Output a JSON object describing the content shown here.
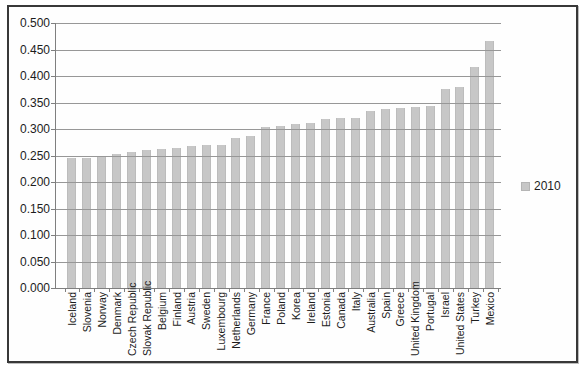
{
  "legend": {
    "label": "2010"
  },
  "chart_data": {
    "type": "bar",
    "title": "",
    "xlabel": "",
    "ylabel": "",
    "categories": [
      "Iceland",
      "Slovenia",
      "Norway",
      "Denmark",
      "Czech Republic",
      "Slovak Republic",
      "Belgium",
      "Finland",
      "Austria",
      "Sweden",
      "Luxembourg",
      "Netherlands",
      "Germany",
      "France",
      "Poland",
      "Korea",
      "Ireland",
      "Estonia",
      "Canada",
      "Italy",
      "Australia",
      "Spain",
      "Greece",
      "United Kingdom",
      "Portugal",
      "Israel",
      "United States",
      "Turkey",
      "Mexico"
    ],
    "series": [
      {
        "name": "2010",
        "values": [
          0.246,
          0.246,
          0.249,
          0.252,
          0.256,
          0.261,
          0.262,
          0.265,
          0.267,
          0.269,
          0.27,
          0.283,
          0.286,
          0.303,
          0.305,
          0.31,
          0.311,
          0.319,
          0.32,
          0.321,
          0.334,
          0.338,
          0.339,
          0.341,
          0.344,
          0.376,
          0.38,
          0.417,
          0.466
        ]
      }
    ],
    "ylim": [
      0.0,
      0.5
    ],
    "ytick_step": 0.05,
    "ytick_labels": [
      "0.000",
      "0.050",
      "0.100",
      "0.150",
      "0.200",
      "0.250",
      "0.300",
      "0.350",
      "0.400",
      "0.450",
      "0.500"
    ],
    "grid": true,
    "legend_position": "right",
    "colors": {
      "bar_fill": "#c7c7c7",
      "bar_edge": "#bcbcbc",
      "gridline": "#979797",
      "axis": "#7f7f7f",
      "frame_border": "#383838",
      "text": "#1c1c1c"
    }
  }
}
